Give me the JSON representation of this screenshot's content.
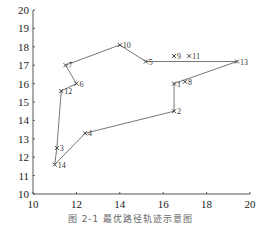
{
  "chart_data": {
    "type": "scatter",
    "title": "",
    "caption": "图 2-1  最优路径轨迹示意图",
    "xlabel": "",
    "ylabel": "",
    "xlim": [
      10,
      20
    ],
    "ylim": [
      10,
      20
    ],
    "x_ticks": [
      10,
      12,
      14,
      16,
      18,
      20
    ],
    "y_ticks": [
      10,
      11,
      12,
      13,
      14,
      15,
      16,
      17,
      18,
      19,
      20
    ],
    "grid": false,
    "legend": null,
    "marker": "x",
    "points": [
      {
        "label": "1",
        "x": 16.5,
        "y": 16.0
      },
      {
        "label": "2",
        "x": 16.5,
        "y": 14.5
      },
      {
        "label": "3",
        "x": 11.1,
        "y": 12.5
      },
      {
        "label": "4",
        "x": 12.4,
        "y": 13.3
      },
      {
        "label": "5",
        "x": 15.2,
        "y": 17.2
      },
      {
        "label": "6",
        "x": 12.0,
        "y": 16.0
      },
      {
        "label": "7",
        "x": 11.5,
        "y": 17.0
      },
      {
        "label": "8",
        "x": 17.0,
        "y": 16.1
      },
      {
        "label": "9",
        "x": 16.5,
        "y": 17.5
      },
      {
        "label": "10",
        "x": 14.0,
        "y": 18.1
      },
      {
        "label": "11",
        "x": 17.2,
        "y": 17.5
      },
      {
        "label": "12",
        "x": 11.3,
        "y": 15.6
      },
      {
        "label": "13",
        "x": 19.4,
        "y": 17.2
      },
      {
        "label": "14",
        "x": 11.0,
        "y": 11.6
      }
    ],
    "route": [
      "1",
      "2",
      "4",
      "14",
      "3",
      "12",
      "6",
      "7",
      "10",
      "5",
      "13",
      "1"
    ]
  },
  "colors": {
    "axis": "#555555",
    "route": "#777777",
    "marker": "#333333"
  }
}
